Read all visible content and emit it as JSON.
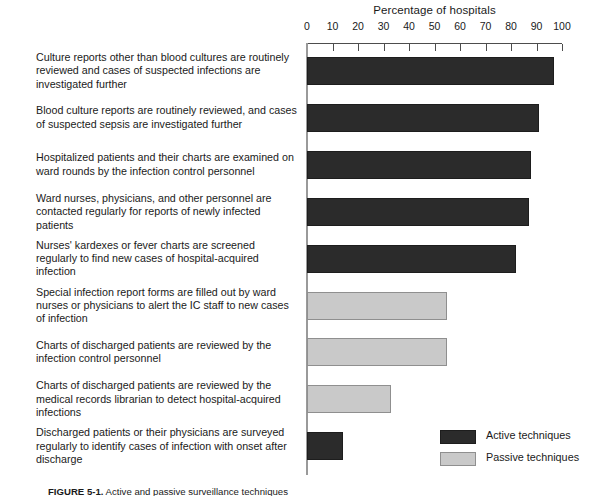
{
  "chart_data": {
    "type": "bar",
    "orientation": "horizontal",
    "title": "",
    "xlabel": "Percentage of hospitals",
    "ylabel": "",
    "xlim": [
      0,
      100
    ],
    "xticks": [
      0,
      10,
      20,
      30,
      40,
      50,
      60,
      70,
      80,
      90,
      100
    ],
    "grid": false,
    "legend_position": "bottom-right",
    "categories": [
      "Culture reports other than blood cultures are routinely reviewed and cases of suspected infections are investigated further",
      "Blood culture reports are routinely reviewed, and cases of suspected sepsis are investigated further",
      "Hospitalized patients and their charts are examined on ward rounds by the infection control personnel",
      "Ward nurses, physicians, and other personnel are contacted regularly for reports of newly infected patients",
      "Nurses' kardexes or fever charts are screened regularly to find new cases of hospital-acquired infection",
      "Special infection report forms are filled out by ward nurses or physicians to alert the IC staff to new cases of infection",
      "Charts of discharged patients are reviewed by the infection control personnel",
      "Charts of discharged patients are reviewed by the medical records librarian to detect hospital-acquired infections",
      "Discharged patients or their physicians are surveyed regularly to identify cases of infection with onset after discharge"
    ],
    "values": [
      97,
      91,
      88,
      87,
      82,
      55,
      55,
      33,
      14
    ],
    "groups": [
      "active",
      "active",
      "active",
      "active",
      "active",
      "passive",
      "passive",
      "passive",
      "active"
    ],
    "series": [
      {
        "name": "Active techniques",
        "color": "#2b2b2b",
        "values": [
          97,
          91,
          88,
          87,
          82,
          null,
          null,
          null,
          14
        ]
      },
      {
        "name": "Passive techniques",
        "color": "#c9c9c9",
        "values": [
          null,
          null,
          null,
          null,
          null,
          55,
          55,
          33,
          null
        ]
      }
    ],
    "legend": [
      {
        "label": "Active techniques",
        "color": "#2b2b2b"
      },
      {
        "label": "Passive techniques",
        "color": "#c9c9c9"
      }
    ]
  },
  "caption": {
    "number": "FIGURE 5-1.",
    "text": "Active and passive surveillance techniques"
  },
  "colors": {
    "active": "#2b2b2b",
    "passive": "#c9c9c9",
    "axis": "#4d4d4d",
    "baseline": "#9a9a9a",
    "text": "#1a1a1a",
    "background": "#ffffff"
  }
}
